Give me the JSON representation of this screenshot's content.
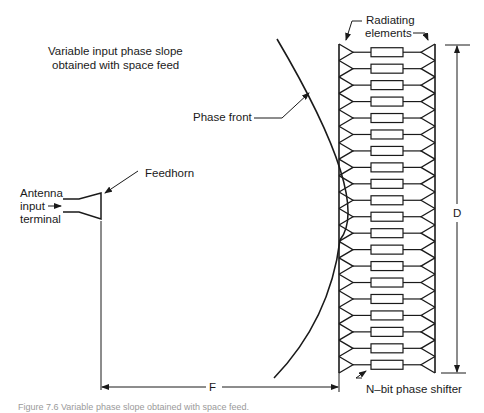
{
  "diagram": {
    "title_line1": "Variable input phase slope",
    "title_line2": "obtained with space feed",
    "labels": {
      "phase_front": "Phase front",
      "feedhorn": "Feedhorn",
      "antenna_line1": "Antenna",
      "antenna_line2": "input",
      "antenna_line3": "terminal",
      "radiating_line1": "Radiating",
      "radiating_line2": "elements",
      "dimension_d": "D",
      "dimension_f": "F",
      "phase_shifter": "N–bit phase shifter"
    },
    "caption": "Figure 7.6  Variable phase slope obtained with space feed.",
    "element_rows": 20,
    "colors": {
      "stroke": "#1a1a1a",
      "background": "#ffffff"
    }
  }
}
